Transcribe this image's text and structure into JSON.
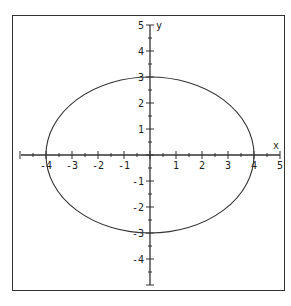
{
  "chart_data": {
    "type": "line",
    "title": "",
    "xlabel": "x",
    "ylabel": "y",
    "xlim": [
      -5,
      5
    ],
    "ylim": [
      -5,
      5
    ],
    "x_ticks": [
      -4,
      -3,
      -2,
      -1,
      1,
      2,
      3,
      4,
      5
    ],
    "y_ticks": [
      5,
      4,
      3,
      2,
      1,
      -1,
      -2,
      -3,
      -4
    ],
    "minor_tick_step": 0.5,
    "grid": false,
    "series": [
      {
        "name": "ellipse",
        "shape": "ellipse",
        "center": [
          0,
          0
        ],
        "semi_axis_x": 4,
        "semi_axis_y": 3,
        "color": "#333333"
      }
    ]
  }
}
